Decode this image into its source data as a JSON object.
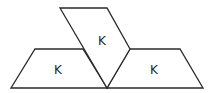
{
  "diagram": {
    "stroke_color": "#2a2a2a",
    "fill_color": "#ffffff",
    "shapes": [
      {
        "name": "left-trapezoid",
        "points": "35,49 83,49 107,88 11,88",
        "label": "K",
        "label_pos": [
          58,
          70
        ]
      },
      {
        "name": "right-trapezoid",
        "points": "130,49 180,49 203,88 107,88",
        "label": "K",
        "label_pos": [
          154,
          70
        ]
      },
      {
        "name": "top-parallelogram",
        "points": "60,8 107,8 130,49 107,88",
        "label": "K",
        "label_pos": [
          102,
          41
        ]
      }
    ]
  }
}
